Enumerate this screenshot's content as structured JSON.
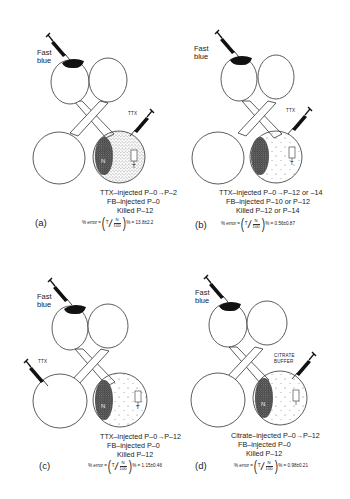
{
  "figure": {
    "panels": [
      {
        "id": "a",
        "label": "(a)",
        "fb_label_line1": "Fast",
        "fb_label_line2": "blue",
        "agent_label": "TTX",
        "agent_site": "bottom-right",
        "lines": [
          "TTX–injected P–0→P–2",
          "FB–injected P–0",
          "Killed   P–12"
        ],
        "formula_prefix": "% error =",
        "formula_num_t": "T",
        "formula_num_n": "N",
        "formula_den": "100",
        "formula_result": "% = 13.8±2.2",
        "region_n": "N",
        "region_t": "T"
      },
      {
        "id": "b",
        "label": "(b)",
        "fb_label_line1": "Fast",
        "fb_label_line2": "blue",
        "agent_label": "TTX",
        "agent_site": "bottom-right",
        "lines": [
          "TTX–injected P–0→P–12 or –14",
          "FB–injected P–10 or P–12",
          "Killed   P–12 or P–14"
        ],
        "formula_prefix": "% error =",
        "formula_num_t": "T",
        "formula_num_n": "N",
        "formula_den": "100",
        "formula_result": "% = 0.56±0.87",
        "region_n": "",
        "region_t": "T"
      },
      {
        "id": "c",
        "label": "(c)",
        "fb_label_line1": "Fast",
        "fb_label_line2": "blue",
        "agent_label": "TTX",
        "agent_site": "bottom-left",
        "lines": [
          "TTX–injected P–0→P–12",
          "FB–injected P–0",
          "Killed   P–12"
        ],
        "formula_prefix": "% error =",
        "formula_num_t": "T",
        "formula_num_n": "N",
        "formula_den": "100",
        "formula_result": "% = 1.15±0.46",
        "region_n": "N",
        "region_t": "T"
      },
      {
        "id": "d",
        "label": "(d)",
        "fb_label_line1": "Fast",
        "fb_label_line2": "blue",
        "agent_label_line1": "CITRATE",
        "agent_label_line2": "BUFFER",
        "agent_site": "bottom-right",
        "lines": [
          "Citrate–injected P–0→P–12",
          "FB–injected P–0",
          "Killed   P–12"
        ],
        "formula_prefix": "% error =",
        "formula_num_t": "T",
        "formula_num_n": "N",
        "formula_den": "100",
        "formula_result": "% = 0.98±0.21",
        "region_n": "N",
        "region_t": "T"
      }
    ]
  }
}
